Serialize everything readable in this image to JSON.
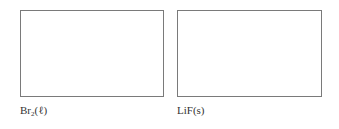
{
  "panels": [
    {
      "label_main": "Br",
      "label_sub": "2",
      "label_suffix": "(ℓ)"
    },
    {
      "label_main": "LiF(s)"
    }
  ],
  "colors": {
    "border": "#7a7a7a",
    "text": "#333333",
    "background": "#ffffff"
  }
}
